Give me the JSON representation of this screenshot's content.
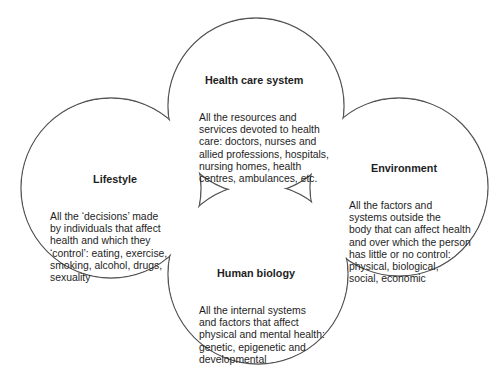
{
  "diagram": {
    "type": "four-overlapping-circles",
    "stroke_color": "#555555",
    "fill_color": "#ffffff",
    "nodes": [
      {
        "id": "health-care-system",
        "title": "Health care system",
        "description": "All the resources and\nservices devoted to health\ncare: doctors, nurses and\nallied professions, hospitals,\nnursing homes, health\ncentres, ambulances, etc.",
        "position": "top"
      },
      {
        "id": "lifestyle",
        "title": "Lifestyle",
        "description": "All the ‘decisions’ made\nby individuals that affect\nhealth and which they\n‘control’: eating, exercise,\nsmoking, alcohol, drugs,\nsexuality",
        "position": "left"
      },
      {
        "id": "environment",
        "title": "Environment",
        "description": "All the factors and\nsystems outside the\nbody that can affect health\nand over which the person\nhas little or no control:\nphysical, biological,\nsocial, economic",
        "position": "right"
      },
      {
        "id": "human-biology",
        "title": "Human biology",
        "description": "All the internal systems\nand factors that affect\nphysical and mental health:\ngenetic, epigenetic and\ndevelopmental",
        "position": "bottom"
      }
    ]
  }
}
